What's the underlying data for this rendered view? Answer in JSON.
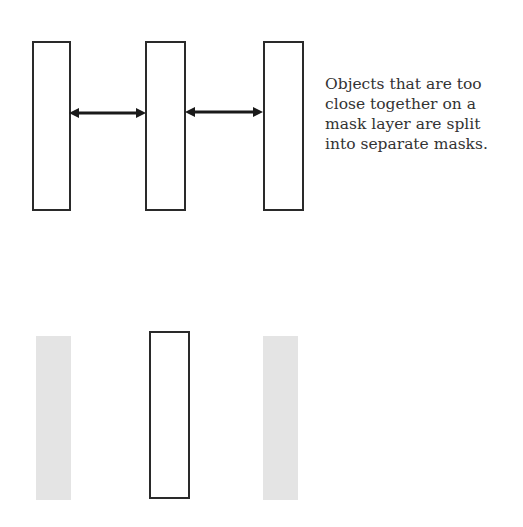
{
  "figure": {
    "caption_lines": [
      "Objects that are too",
      "close together on a",
      "mask layer are split",
      "into separate masks."
    ],
    "top_row": {
      "shapes": [
        "rect-outline",
        "rect-outline",
        "rect-outline"
      ],
      "arrows": [
        "double-arrow-left-middle",
        "double-arrow-middle-right"
      ]
    },
    "bottom_row": {
      "shapes": [
        "rect-gray-fill",
        "rect-outline",
        "rect-gray-fill"
      ]
    },
    "colors": {
      "stroke": "#2a2a2a",
      "gray_fill": "#e4e4e4",
      "text": "#333333"
    }
  }
}
